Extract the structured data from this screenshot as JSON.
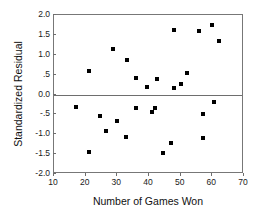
{
  "chart_data": {
    "type": "scatter",
    "title": "",
    "xlabel": "Number of Games Won",
    "ylabel": "Standardized Residual",
    "xlim": [
      10,
      70
    ],
    "ylim": [
      -2.0,
      2.0
    ],
    "xticks": [
      10,
      20,
      30,
      40,
      50,
      60,
      70
    ],
    "xticklabels": [
      "10",
      "20",
      "30",
      "40",
      "50",
      "60",
      "70"
    ],
    "yticks": [
      2.0,
      1.5,
      1.0,
      0.5,
      0.0,
      -0.5,
      -1.0,
      -1.5,
      -2.0
    ],
    "yticklabels": [
      "2.0",
      "1.5",
      "1.0",
      ".5",
      "0.0",
      "-.5",
      "-1.0",
      "-1.5",
      "-2.0"
    ],
    "grid": false,
    "legend": null,
    "reference_line": {
      "y": 0.0,
      "style": "solid",
      "color": "#6e6e6e"
    },
    "marker": {
      "shape": "square",
      "size": 4,
      "color": "#000000"
    },
    "points": [
      {
        "x": 17.0,
        "y": -0.31
      },
      {
        "x": 21.0,
        "y": 0.58
      },
      {
        "x": 21.2,
        "y": -1.44
      },
      {
        "x": 24.6,
        "y": -0.53
      },
      {
        "x": 26.4,
        "y": -0.93
      },
      {
        "x": 28.5,
        "y": 1.14
      },
      {
        "x": 30.0,
        "y": -0.67
      },
      {
        "x": 32.6,
        "y": -1.06
      },
      {
        "x": 33.2,
        "y": 0.87
      },
      {
        "x": 35.8,
        "y": -0.35
      },
      {
        "x": 36.0,
        "y": 0.41
      },
      {
        "x": 39.4,
        "y": 0.18
      },
      {
        "x": 41.0,
        "y": -0.43
      },
      {
        "x": 42.0,
        "y": -0.33
      },
      {
        "x": 42.4,
        "y": 0.39
      },
      {
        "x": 44.4,
        "y": -1.48
      },
      {
        "x": 46.8,
        "y": -1.23
      },
      {
        "x": 47.8,
        "y": 0.16
      },
      {
        "x": 48.0,
        "y": 1.62
      },
      {
        "x": 50.0,
        "y": 0.26
      },
      {
        "x": 52.0,
        "y": 0.53
      },
      {
        "x": 55.8,
        "y": 1.6
      },
      {
        "x": 57.0,
        "y": -0.49
      },
      {
        "x": 57.2,
        "y": -1.09
      },
      {
        "x": 59.8,
        "y": 1.76
      },
      {
        "x": 60.6,
        "y": -0.19
      },
      {
        "x": 62.0,
        "y": 1.35
      }
    ]
  }
}
